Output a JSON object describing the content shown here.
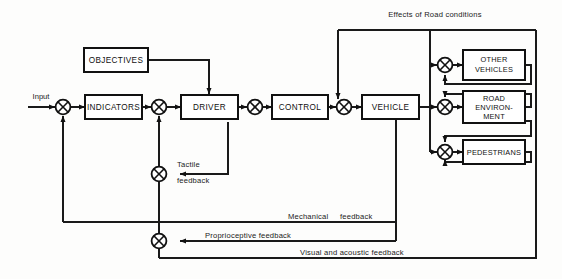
{
  "diagram": {
    "canvas": {
      "width": 562,
      "height": 279
    },
    "colors": {
      "line": "#1a1a1a",
      "box_stroke": "#111111",
      "box_fill": "#ffffff",
      "background": "#fdfdfc"
    },
    "input_label": "Input",
    "blocks": [
      {
        "id": "objectives",
        "label": "OBJECTIVES",
        "lines": [
          "OBJECTIVES"
        ]
      },
      {
        "id": "indicators",
        "label": "INDICATORS",
        "lines": [
          "INDICATORS"
        ]
      },
      {
        "id": "driver",
        "label": "DRIVER",
        "lines": [
          "DRIVER"
        ]
      },
      {
        "id": "control",
        "label": "CONTROL",
        "lines": [
          "CONTROL"
        ]
      },
      {
        "id": "vehicle",
        "label": "VEHICLE",
        "lines": [
          "VEHICLE"
        ]
      },
      {
        "id": "other-vehicles",
        "label": "OTHER VEHICLES",
        "lines": [
          "OTHER",
          "VEHICLES"
        ]
      },
      {
        "id": "road-environment",
        "label": "ROAD ENVIRONMENT",
        "lines": [
          "ROAD",
          "ENVIRON-",
          "MENT"
        ]
      },
      {
        "id": "pedestrians",
        "label": "PEDESTRIANS",
        "lines": [
          "PEDESTRIANS"
        ]
      }
    ],
    "annotations": [
      {
        "id": "effects-road-conditions",
        "text": "Effects of Road conditions"
      },
      {
        "id": "tactile-line1",
        "text": "Tactile"
      },
      {
        "id": "tactile-line2",
        "text": "feedback"
      },
      {
        "id": "mechanical",
        "text": "Mechanical"
      },
      {
        "id": "mechanical-feedback",
        "text": "feedback"
      },
      {
        "id": "proprioceptive",
        "text": "Proprioceptive feedback"
      },
      {
        "id": "visual-acoustic",
        "text": "Visual and acoustic feedback"
      }
    ],
    "summing_junctions": [
      {
        "id": "j-input"
      },
      {
        "id": "j-driver-in"
      },
      {
        "id": "j-control-out"
      },
      {
        "id": "j-tactile"
      },
      {
        "id": "j-proprioceptive"
      },
      {
        "id": "j-other-vehicles"
      },
      {
        "id": "j-road-environment"
      },
      {
        "id": "j-pedestrians"
      }
    ]
  }
}
